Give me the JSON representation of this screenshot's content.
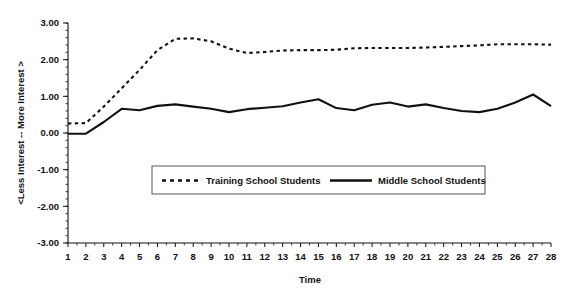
{
  "chart_data": {
    "type": "line",
    "title": "",
    "xlabel": "Time",
    "ylabel": "<Less Interest  --  More Interest >",
    "xlim": [
      1,
      28
    ],
    "ylim": [
      -3.0,
      3.0
    ],
    "grid": false,
    "legend_position": "center",
    "x": [
      1,
      2,
      3,
      4,
      5,
      6,
      7,
      8,
      9,
      10,
      11,
      12,
      13,
      14,
      15,
      16,
      17,
      18,
      19,
      20,
      21,
      22,
      23,
      24,
      25,
      26,
      27,
      28
    ],
    "xtick_labels": [
      "1",
      "2",
      "3",
      "4",
      "5",
      "6",
      "7",
      "8",
      "9",
      "10",
      "11",
      "12",
      "13",
      "14",
      "15",
      "16",
      "17",
      "18",
      "19",
      "20",
      "21",
      "22",
      "23",
      "24",
      "25",
      "26",
      "27",
      "28"
    ],
    "ytick_values": [
      3.0,
      2.0,
      1.0,
      0.0,
      -1.0,
      -2.0,
      -3.0
    ],
    "ytick_labels": [
      "3.00",
      "2.00",
      "1.00",
      "0.00",
      "-1.00",
      "-2.00",
      "-3.00"
    ],
    "series": [
      {
        "name": "Training School Students",
        "style": "dashed",
        "color": "#111111",
        "values": [
          0.26,
          0.27,
          0.72,
          1.22,
          1.72,
          2.26,
          2.57,
          2.58,
          2.5,
          2.3,
          2.18,
          2.21,
          2.25,
          2.26,
          2.26,
          2.27,
          2.31,
          2.32,
          2.32,
          2.32,
          2.33,
          2.35,
          2.37,
          2.39,
          2.42,
          2.42,
          2.42,
          2.41
        ]
      },
      {
        "name": "Middle School Students",
        "style": "solid",
        "color": "#111111",
        "values": [
          -0.02,
          -0.02,
          0.3,
          0.66,
          0.62,
          0.74,
          0.78,
          0.72,
          0.66,
          0.57,
          0.65,
          0.69,
          0.73,
          0.83,
          0.92,
          0.68,
          0.62,
          0.77,
          0.83,
          0.72,
          0.78,
          0.68,
          0.6,
          0.57,
          0.66,
          0.83,
          1.05,
          0.73
        ]
      }
    ]
  },
  "legend": {
    "items": [
      {
        "label": "Training School Students",
        "style": "dashed"
      },
      {
        "label": "Middle School Students",
        "style": "solid"
      }
    ]
  },
  "axes": {
    "x_title": "Time",
    "y_title": "<Less Interest  --  More Interest >"
  }
}
